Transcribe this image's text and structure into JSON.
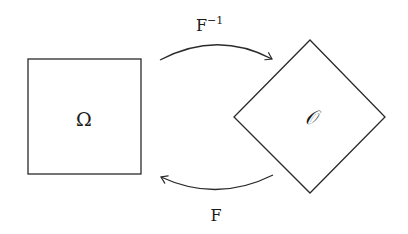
{
  "diagram": {
    "left_shape": {
      "type": "square",
      "label": "Ω"
    },
    "right_shape": {
      "type": "diamond",
      "label": "𝒪"
    },
    "arrows": [
      {
        "direction": "left-to-right",
        "position": "top",
        "label_base": "F",
        "label_sup": "−1"
      },
      {
        "direction": "right-to-left",
        "position": "bottom",
        "label_base": "F",
        "label_sup": ""
      }
    ],
    "colors": {
      "stroke": "#2a2a2a",
      "background": "#ffffff"
    }
  }
}
